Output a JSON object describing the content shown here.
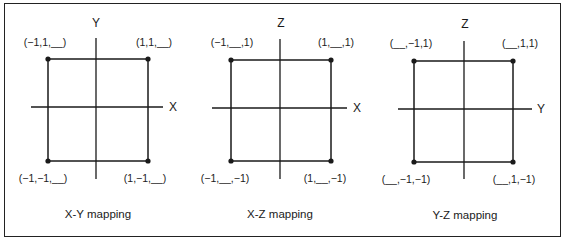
{
  "figure": {
    "panels": [
      {
        "id": "xy",
        "caption": "X-Y mapping",
        "horizontal_axis_label": "X",
        "vertical_axis_label": "Y",
        "corners": {
          "top_left": "(−1,1,__)",
          "top_right": "(1,1,__)",
          "bottom_left": "(−1,−1,__)",
          "bottom_right": "(1,−1,__)"
        }
      },
      {
        "id": "xz",
        "caption": "X-Z mapping",
        "horizontal_axis_label": "X",
        "vertical_axis_label": "Z",
        "corners": {
          "top_left": "(−1,__,1)",
          "top_right": "(1,__,1)",
          "bottom_left": "(−1,__,−1)",
          "bottom_right": "(1,__,−1)"
        }
      },
      {
        "id": "yz",
        "caption": "Y-Z mapping",
        "horizontal_axis_label": "Y",
        "vertical_axis_label": "Z",
        "corners": {
          "top_left": "(__,−1,1)",
          "top_right": "(__,1,1)",
          "bottom_left": "(__,−1,−1)",
          "bottom_right": "(__,1,−1)"
        }
      }
    ],
    "colors": {
      "line": "#1a1a1a",
      "background": "#ffffff"
    }
  }
}
